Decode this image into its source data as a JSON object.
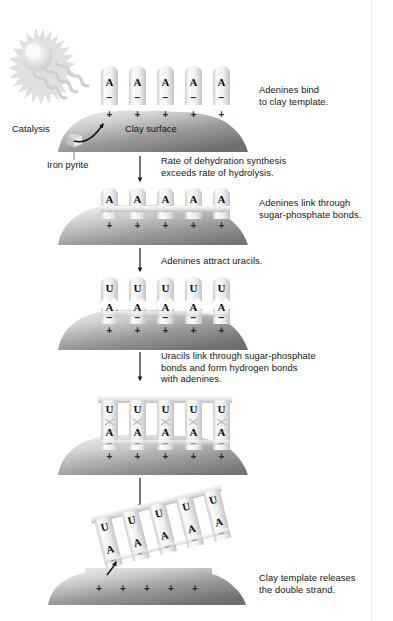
{
  "figure": {
    "background_color": "#ffffff",
    "clay_color_light": "#e8e8e8",
    "clay_color_dark": "#808080",
    "tile_color": "#efefef",
    "text_color": "#141414"
  },
  "annotations": {
    "sun": "sun-icon",
    "catalysis": "Catalysis",
    "iron_pyrite": "Iron pyrite",
    "clay_surface": "Clay surface"
  },
  "stages": [
    {
      "id": "stage-1",
      "caption": "Adenines bind\nto clay template.",
      "top_bases": [],
      "bottom_bases": [
        "A",
        "A",
        "A",
        "A",
        "A"
      ],
      "negative_signs": [
        "−",
        "−",
        "−",
        "−",
        "−"
      ],
      "positive_signs": [
        "+",
        "+",
        "+",
        "+",
        "+"
      ],
      "linked_bottom": false,
      "linked_top": false,
      "released": false
    },
    {
      "id": "stage-2",
      "caption": "Adenines link through\nsugar-phosphate bonds.",
      "top_bases": [],
      "bottom_bases": [
        "A",
        "A",
        "A",
        "A",
        "A"
      ],
      "negative_signs": [
        "−",
        "−",
        "−",
        "−",
        "−"
      ],
      "positive_signs": [
        "+",
        "+",
        "+",
        "+",
        "+"
      ],
      "linked_bottom": true,
      "linked_top": false,
      "released": false
    },
    {
      "id": "stage-3",
      "caption": "Adenines attract uracils.",
      "top_bases": [
        "U",
        "U",
        "U",
        "U",
        "U"
      ],
      "bottom_bases": [
        "A",
        "A",
        "A",
        "A",
        "A"
      ],
      "negative_signs": [
        "−",
        "−",
        "−",
        "−",
        "−"
      ],
      "positive_signs": [
        "+",
        "+",
        "+",
        "+",
        "+"
      ],
      "linked_bottom": true,
      "linked_top": false,
      "released": false
    },
    {
      "id": "stage-4",
      "caption": "Uracils link through sugar-phosphate\nbonds and form hydrogen bonds\nwith adenines.",
      "top_bases": [
        "U",
        "U",
        "U",
        "U",
        "U"
      ],
      "bottom_bases": [
        "A",
        "A",
        "A",
        "A",
        "A"
      ],
      "negative_signs": [
        "−",
        "−",
        "−",
        "−",
        "−"
      ],
      "positive_signs": [
        "+",
        "+",
        "+",
        "+",
        "+"
      ],
      "linked_bottom": true,
      "linked_top": true,
      "released": false
    },
    {
      "id": "stage-5",
      "caption": "Clay template releases\nthe double strand.",
      "top_bases": [
        "U",
        "U",
        "U",
        "U",
        "U"
      ],
      "bottom_bases": [
        "A",
        "A",
        "A",
        "A",
        "A"
      ],
      "negative_signs": [
        "−",
        "−",
        "−",
        "−",
        "−"
      ],
      "positive_signs": [
        "+",
        "+",
        "+",
        "+",
        "+"
      ],
      "linked_bottom": true,
      "linked_top": true,
      "released": true
    }
  ],
  "flow_arrows": [
    {
      "id": "arrow-1",
      "caption": "Rate of dehydration synthesis\nexceeds rate of hydrolysis."
    },
    {
      "id": "arrow-2",
      "caption": ""
    },
    {
      "id": "arrow-3",
      "caption": ""
    },
    {
      "id": "arrow-4",
      "caption": ""
    }
  ]
}
